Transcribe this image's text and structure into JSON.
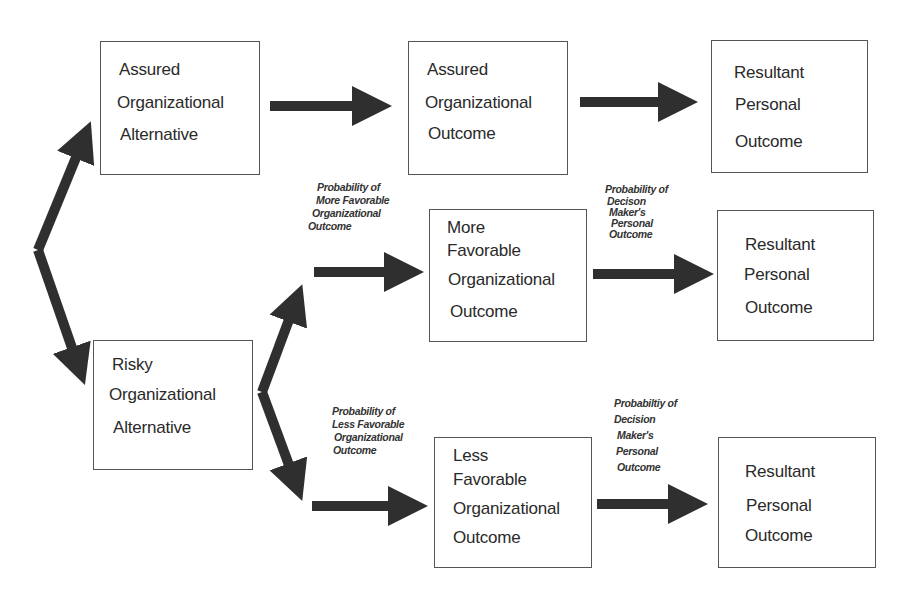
{
  "diagram": {
    "type": "decision-tree",
    "colors": {
      "arrow": "#2f2f2f",
      "box_border": "#555555",
      "background": "#ffffff"
    },
    "boxes": {
      "assured_alternative": {
        "lines": [
          "Assured",
          "Organizational",
          "Alternative"
        ]
      },
      "risky_alternative": {
        "lines": [
          "Risky",
          "Organizational",
          "Alternative"
        ]
      },
      "assured_outcome": {
        "lines": [
          "Assured",
          "Organizational",
          "Outcome"
        ]
      },
      "more_favorable_outcome": {
        "lines": [
          "More",
          "Favorable",
          "Organizational",
          "Outcome"
        ]
      },
      "less_favorable_outcome": {
        "lines": [
          "Less",
          "Favorable",
          "Organizational",
          "Outcome"
        ]
      },
      "resultant_personal_1": {
        "lines": [
          "Resultant",
          "Personal",
          "Outcome"
        ]
      },
      "resultant_personal_2": {
        "lines": [
          "Resultant",
          "Personal",
          "Outcome"
        ]
      },
      "resultant_personal_3": {
        "lines": [
          "Resultant",
          "Personal",
          "Outcome"
        ]
      }
    },
    "labels": {
      "prob_more_favorable": [
        "Probability of",
        "More Favorable",
        "Organizational",
        "Outcome"
      ],
      "prob_less_favorable": [
        "Probability of",
        "Less Favorable",
        "Organizational",
        "Outcome"
      ],
      "prob_personal_upper": [
        "Probability of",
        "Decison",
        "Maker's",
        "Personal",
        "Outcome"
      ],
      "prob_personal_lower": [
        "Probabiltiy of",
        "Decision",
        "Maker's",
        "Personal",
        "Outcome"
      ]
    },
    "edges": [
      {
        "from": "root",
        "to": "assured_alternative"
      },
      {
        "from": "root",
        "to": "risky_alternative"
      },
      {
        "from": "assured_alternative",
        "to": "assured_outcome"
      },
      {
        "from": "assured_outcome",
        "to": "resultant_personal_1"
      },
      {
        "from": "risky_alternative",
        "to": "more_favorable_outcome",
        "label": "prob_more_favorable"
      },
      {
        "from": "risky_alternative",
        "to": "less_favorable_outcome",
        "label": "prob_less_favorable"
      },
      {
        "from": "more_favorable_outcome",
        "to": "resultant_personal_2",
        "label": "prob_personal_upper"
      },
      {
        "from": "less_favorable_outcome",
        "to": "resultant_personal_3",
        "label": "prob_personal_lower"
      }
    ]
  }
}
